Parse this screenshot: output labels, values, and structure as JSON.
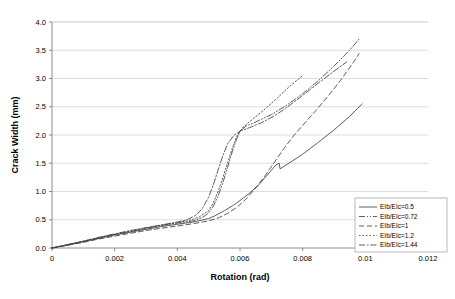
{
  "chart_data": {
    "type": "line",
    "title": "",
    "xlabel": "Rotation (rad)",
    "ylabel": "Crack Width (mm)",
    "xlim": [
      0,
      0.012
    ],
    "ylim": [
      0,
      4.0
    ],
    "xticks": [
      "0",
      "0.002",
      "0.004",
      "0.006",
      "0.008",
      "0.01",
      "0.012"
    ],
    "xtick_values": [
      0,
      0.002,
      0.004,
      0.006,
      0.008,
      0.01,
      0.012
    ],
    "yticks": [
      "0.0",
      "0.5",
      "1.0",
      "1.5",
      "2.0",
      "2.5",
      "3.0",
      "3.5",
      "4.0"
    ],
    "ytick_values": [
      0,
      0.5,
      1.0,
      1.5,
      2.0,
      2.5,
      3.0,
      3.5,
      4.0
    ],
    "grid": "horizontal",
    "legend_position": "lower-right-inside",
    "line_color": "#404040",
    "grid_color": "#d0d0d0",
    "axis_color": "#808080",
    "series": [
      {
        "name": "EIb/EIc=0.5",
        "dash": "solid",
        "dasharray": "",
        "points": [
          [
            0,
            0
          ],
          [
            0.0005,
            0.05
          ],
          [
            0.001,
            0.11
          ],
          [
            0.0015,
            0.17
          ],
          [
            0.002,
            0.23
          ],
          [
            0.0025,
            0.28
          ],
          [
            0.003,
            0.33
          ],
          [
            0.0035,
            0.38
          ],
          [
            0.004,
            0.42
          ],
          [
            0.0045,
            0.46
          ],
          [
            0.005,
            0.52
          ],
          [
            0.0052,
            0.57
          ],
          [
            0.0055,
            0.66
          ],
          [
            0.0058,
            0.76
          ],
          [
            0.006,
            0.84
          ],
          [
            0.0063,
            0.97
          ],
          [
            0.0066,
            1.12
          ],
          [
            0.0069,
            1.31
          ],
          [
            0.00715,
            1.47
          ],
          [
            0.00725,
            1.5
          ],
          [
            0.00728,
            1.4
          ],
          [
            0.0075,
            1.48
          ],
          [
            0.008,
            1.66
          ],
          [
            0.0085,
            1.87
          ],
          [
            0.009,
            2.09
          ],
          [
            0.0095,
            2.33
          ],
          [
            0.0099,
            2.55
          ]
        ]
      },
      {
        "name": "EIb/EIc=0.72",
        "dash": "dash-dot-dot",
        "dasharray": "6,2,1,2,1,2",
        "points": [
          [
            0,
            0
          ],
          [
            0.0005,
            0.06
          ],
          [
            0.001,
            0.12
          ],
          [
            0.0015,
            0.18
          ],
          [
            0.002,
            0.24
          ],
          [
            0.0025,
            0.29
          ],
          [
            0.003,
            0.35
          ],
          [
            0.0035,
            0.4
          ],
          [
            0.004,
            0.44
          ],
          [
            0.0045,
            0.48
          ],
          [
            0.0048,
            0.54
          ],
          [
            0.005,
            0.62
          ],
          [
            0.00515,
            0.74
          ],
          [
            0.0053,
            0.92
          ],
          [
            0.00545,
            1.15
          ],
          [
            0.0056,
            1.42
          ],
          [
            0.00575,
            1.7
          ],
          [
            0.0059,
            1.94
          ],
          [
            0.006,
            2.07
          ],
          [
            0.0062,
            2.16
          ],
          [
            0.0065,
            2.23
          ],
          [
            0.007,
            2.36
          ],
          [
            0.0075,
            2.53
          ],
          [
            0.008,
            2.73
          ],
          [
            0.0085,
            2.96
          ],
          [
            0.009,
            3.22
          ],
          [
            0.0095,
            3.5
          ],
          [
            0.0098,
            3.7
          ]
        ]
      },
      {
        "name": "EIb/EIc=1",
        "dash": "dashed",
        "dasharray": "5,3",
        "points": [
          [
            0,
            0
          ],
          [
            0.0005,
            0.05
          ],
          [
            0.001,
            0.1
          ],
          [
            0.0015,
            0.16
          ],
          [
            0.002,
            0.21
          ],
          [
            0.0025,
            0.26
          ],
          [
            0.003,
            0.31
          ],
          [
            0.0035,
            0.35
          ],
          [
            0.004,
            0.39
          ],
          [
            0.0045,
            0.43
          ],
          [
            0.005,
            0.48
          ],
          [
            0.0053,
            0.53
          ],
          [
            0.0056,
            0.61
          ],
          [
            0.0059,
            0.72
          ],
          [
            0.0062,
            0.87
          ],
          [
            0.0065,
            1.06
          ],
          [
            0.0068,
            1.28
          ],
          [
            0.0071,
            1.52
          ],
          [
            0.0074,
            1.76
          ],
          [
            0.0077,
            1.98
          ],
          [
            0.008,
            2.17
          ],
          [
            0.0084,
            2.42
          ],
          [
            0.0088,
            2.68
          ],
          [
            0.0092,
            2.96
          ],
          [
            0.0096,
            3.27
          ],
          [
            0.0098,
            3.44
          ]
        ]
      },
      {
        "name": "EIb/EIc=1.2",
        "dash": "dotted",
        "dasharray": "1.5,2",
        "points": [
          [
            0,
            0
          ],
          [
            0.0005,
            0.06
          ],
          [
            0.001,
            0.12
          ],
          [
            0.0015,
            0.18
          ],
          [
            0.002,
            0.24
          ],
          [
            0.0025,
            0.3
          ],
          [
            0.003,
            0.35
          ],
          [
            0.0035,
            0.4
          ],
          [
            0.004,
            0.45
          ],
          [
            0.0044,
            0.49
          ],
          [
            0.0047,
            0.55
          ],
          [
            0.005,
            0.66
          ],
          [
            0.00515,
            0.8
          ],
          [
            0.0053,
            1.0
          ],
          [
            0.00545,
            1.24
          ],
          [
            0.0056,
            1.5
          ],
          [
            0.00575,
            1.76
          ],
          [
            0.0059,
            1.98
          ],
          [
            0.0061,
            2.14
          ],
          [
            0.0064,
            2.28
          ],
          [
            0.0068,
            2.46
          ],
          [
            0.0072,
            2.66
          ],
          [
            0.0076,
            2.87
          ],
          [
            0.008,
            3.05
          ]
        ]
      },
      {
        "name": "EIb/EIc=1.44",
        "dash": "dash-dot",
        "dasharray": "6,2,1.5,2",
        "points": [
          [
            0,
            0
          ],
          [
            0.0005,
            0.06
          ],
          [
            0.001,
            0.12
          ],
          [
            0.0015,
            0.19
          ],
          [
            0.002,
            0.25
          ],
          [
            0.0025,
            0.31
          ],
          [
            0.003,
            0.36
          ],
          [
            0.0035,
            0.41
          ],
          [
            0.004,
            0.46
          ],
          [
            0.0043,
            0.5
          ],
          [
            0.0046,
            0.58
          ],
          [
            0.0048,
            0.7
          ],
          [
            0.005,
            0.9
          ],
          [
            0.00515,
            1.12
          ],
          [
            0.0053,
            1.38
          ],
          [
            0.00545,
            1.63
          ],
          [
            0.0056,
            1.84
          ],
          [
            0.0058,
            1.99
          ],
          [
            0.006,
            2.07
          ],
          [
            0.0063,
            2.13
          ],
          [
            0.0067,
            2.22
          ],
          [
            0.0071,
            2.34
          ],
          [
            0.0075,
            2.49
          ],
          [
            0.008,
            2.7
          ],
          [
            0.0085,
            2.92
          ],
          [
            0.009,
            3.13
          ],
          [
            0.0094,
            3.29
          ]
        ]
      }
    ]
  }
}
